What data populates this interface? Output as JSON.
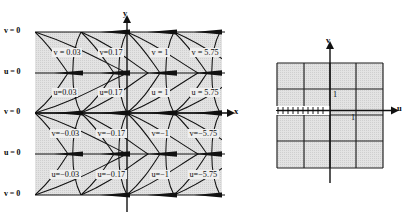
{
  "figure": {
    "title": "",
    "panels": [
      "z-plane",
      "w-plane"
    ]
  },
  "left_panel": {
    "name": "xy-plane-conformal-map",
    "axes": {
      "x_label": "x",
      "y_label": "y"
    },
    "edge_labels": [
      {
        "text": "v = 0",
        "row": 0
      },
      {
        "text": "u = 0",
        "row": 1
      },
      {
        "text": "v = 0",
        "row": 2
      },
      {
        "text": "u = 0",
        "row": 3
      },
      {
        "text": "v = 0",
        "row": 4
      }
    ],
    "region_rows": [
      {
        "variable": "v",
        "cells": [
          {
            "text": "v = 0.03"
          },
          {
            "text": "v=0.17"
          },
          {
            "text": "v = 1"
          },
          {
            "text": "v = 5.75"
          }
        ]
      },
      {
        "variable": "u",
        "cells": [
          {
            "text": "u=0.03"
          },
          {
            "text": "u=0.17"
          },
          {
            "text": "u = 1"
          },
          {
            "text": "u = 5.75"
          }
        ]
      },
      {
        "variable": "v",
        "cells": [
          {
            "text": "v=−0.03"
          },
          {
            "text": "v=−0.17"
          },
          {
            "text": "v=−1"
          },
          {
            "text": "v=−5.75"
          }
        ]
      },
      {
        "variable": "u",
        "cells": [
          {
            "text": "u=−0.03"
          },
          {
            "text": "u=−0.17"
          },
          {
            "text": "u=−1"
          },
          {
            "text": "u=−5.75"
          }
        ]
      }
    ]
  },
  "right_panel": {
    "name": "uv-plane-grid",
    "axes": {
      "u_label": "u",
      "v_label": "v"
    },
    "tick_labels": [
      {
        "text": "1",
        "position": "above-u-axis-right-of-v-axis"
      },
      {
        "text": "1",
        "position": "below-u-axis-right-of-v-axis"
      }
    ],
    "hatch_marks": 10,
    "grid_lines_vertical": 5,
    "grid_lines_horizontal": 5
  },
  "colors": {
    "shade": "#e0e0e0",
    "stroke": "#1a1a1a",
    "background": "#ffffff"
  }
}
